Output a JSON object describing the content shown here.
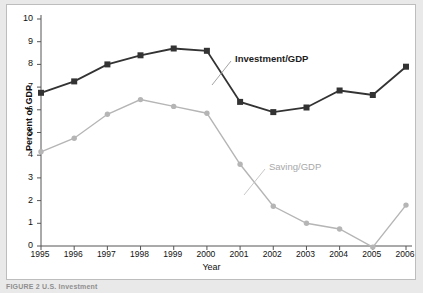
{
  "figure": {
    "caption": "FIGURE 2   U.S. Investment",
    "axis_color": "#555555",
    "background": "#ffffff"
  },
  "chart_data": {
    "type": "line",
    "title": "",
    "xlabel": "Year",
    "ylabel": "Percent of GDP",
    "categories": [
      "1995",
      "1996",
      "1997",
      "1998",
      "1999",
      "2000",
      "2001",
      "2002",
      "2003",
      "2004",
      "2005",
      "2006"
    ],
    "xlim": [
      1995,
      2006
    ],
    "ylim": [
      0,
      10
    ],
    "ytick_labels": [
      "0",
      "1",
      "2",
      "3",
      "4",
      "5",
      "6",
      "7",
      "8",
      "9",
      "10"
    ],
    "ytick_values": [
      0,
      1,
      2,
      3,
      4,
      5,
      6,
      7,
      8,
      9,
      10
    ],
    "grid": false,
    "legend": "inline-annotations",
    "series": [
      {
        "name": "Investment/GDP",
        "color": "#333333",
        "marker": "square",
        "values": [
          6.75,
          7.25,
          8.0,
          8.4,
          8.7,
          8.6,
          6.35,
          5.9,
          6.1,
          6.85,
          6.65,
          7.9
        ]
      },
      {
        "name": "Saving/GDP",
        "color": "#b5b5b5",
        "marker": "circle",
        "values": [
          4.15,
          4.75,
          5.8,
          6.45,
          6.15,
          5.85,
          3.6,
          1.75,
          1.0,
          0.75,
          -0.05,
          1.8
        ]
      }
    ],
    "annotations": [
      {
        "text": "Investment/GDP",
        "x": 2001.0,
        "y": 8.1,
        "color": "#1c1c1c",
        "bold": true
      },
      {
        "text": "Saving/GDP",
        "x": 2002.0,
        "y": 3.45,
        "color": "#a8a8a8",
        "bold": false
      }
    ]
  }
}
